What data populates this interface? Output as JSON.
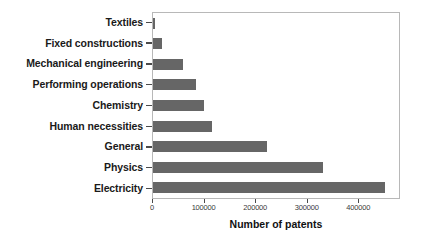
{
  "chart_data": {
    "type": "bar",
    "orientation": "horizontal",
    "title": "",
    "xlabel": "Number of patents",
    "ylabel": "",
    "categories": [
      "Textiles",
      "Fixed constructions",
      "Mechanical engineering",
      "Performing operations",
      "Chemistry",
      "Human necessities",
      "General",
      "Physics",
      "Electricity"
    ],
    "values": [
      3000,
      17000,
      58000,
      84000,
      98000,
      115000,
      221000,
      329000,
      450000
    ],
    "xlim": [
      0,
      477000
    ],
    "xticks": [
      0,
      100000,
      200000,
      300000,
      400000
    ],
    "xticklabels": [
      "0",
      "100000",
      "200000",
      "300000",
      "400000"
    ],
    "grid": false,
    "legend": null,
    "bar_color": "#666666",
    "axis_color": "#b8b8b8",
    "label_color": "#1a1a1a"
  }
}
